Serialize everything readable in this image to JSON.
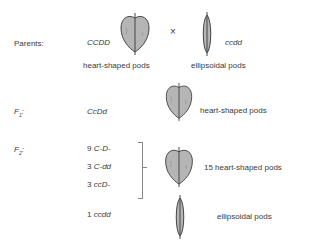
{
  "parents": {
    "label": "Parents:",
    "genotype_left": "CCDD",
    "cross_symbol": "×",
    "genotype_right": "ccdd",
    "phenotype_left": "heart-shaped pods",
    "phenotype_right": "ellipsoidal pods"
  },
  "f1": {
    "label_main": "F",
    "label_sub": "1",
    "label_colon": ":",
    "genotype": "CcDd",
    "phenotype": "heart-shaped pods"
  },
  "f2": {
    "label_main": "F",
    "label_sub": "2",
    "label_colon": ":",
    "rows": [
      {
        "count": "9",
        "genotype": "C-D-"
      },
      {
        "count": "3",
        "genotype": "C-dd"
      },
      {
        "count": "3",
        "genotype": "ccD-"
      },
      {
        "count": "1",
        "genotype": "ccdd"
      }
    ],
    "heart_phenotype": "15 heart-shaped pods",
    "ellipsoid_phenotype": "ellipsoidal pods"
  },
  "colors": {
    "pod_fill": "#b5b5b5",
    "pod_stroke": "#444444",
    "text": "#3a3a3a"
  }
}
